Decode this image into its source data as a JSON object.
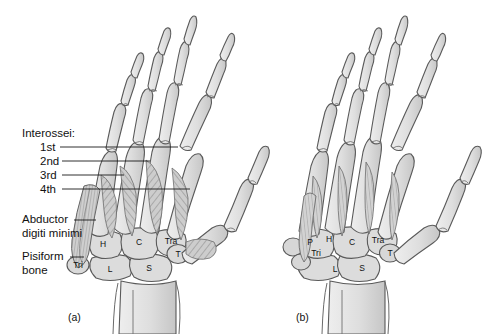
{
  "figure": {
    "type": "anatomical-illustration",
    "background_color": "#ffffff",
    "bone_fill": "#dcdcdc",
    "bone_fill_light": "#e9e9e9",
    "bone_outline": "#555555",
    "muscle_fill": "#c9c9c9",
    "muscle_stripe": "#8a8a8a",
    "leader_color": "#1a1a1a"
  },
  "annotations": {
    "group_heading": "Interossei:",
    "items": [
      {
        "label": "1st"
      },
      {
        "label": "2nd"
      },
      {
        "label": "3rd"
      },
      {
        "label": "4th"
      }
    ],
    "abductor": {
      "line1": "Abductor",
      "line2": "digiti minimi"
    },
    "pisiform": {
      "line1": "Pisiform",
      "line2": "bone"
    }
  },
  "panels": [
    {
      "id": "a",
      "caption": "(a)",
      "view": "dorsal interossei",
      "carpal_labels": [
        {
          "text": "H",
          "name": "hamate"
        },
        {
          "text": "C",
          "name": "capitate"
        },
        {
          "text": "Tra",
          "name": "trapezoid"
        },
        {
          "text": "T",
          "name": "trapezium"
        },
        {
          "text": "Tri",
          "name": "triquetral"
        },
        {
          "text": "L",
          "name": "lunate"
        },
        {
          "text": "S",
          "name": "scaphoid"
        }
      ]
    },
    {
      "id": "b",
      "caption": "(b)",
      "view": "palmar interossei",
      "carpal_labels": [
        {
          "text": "P",
          "name": "pisiform"
        },
        {
          "text": "H",
          "name": "hamate"
        },
        {
          "text": "C",
          "name": "capitate"
        },
        {
          "text": "Tra",
          "name": "trapezoid"
        },
        {
          "text": "T",
          "name": "trapezium"
        },
        {
          "text": "Tri",
          "name": "triquetral"
        },
        {
          "text": "L",
          "name": "lunate"
        },
        {
          "text": "S",
          "name": "scaphoid"
        }
      ]
    }
  ]
}
